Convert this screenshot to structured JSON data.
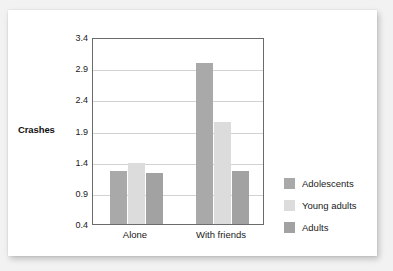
{
  "chart_data": {
    "type": "bar",
    "title": "",
    "xlabel": "",
    "ylabel": "Crashes",
    "categories": [
      "Alone",
      "With friends"
    ],
    "series": [
      {
        "name": "Adolescents",
        "color": "#a9a9a9",
        "values": [
          1.25,
          2.98
        ]
      },
      {
        "name": "Young adults",
        "color": "#dcdcdc",
        "values": [
          1.38,
          2.03
        ]
      },
      {
        "name": "Adults",
        "color": "#a2a2a2",
        "values": [
          1.22,
          1.25
        ]
      }
    ],
    "ylim": [
      0.4,
      3.4
    ],
    "ytick_values": [
      0.4,
      0.9,
      1.4,
      1.9,
      2.4,
      2.9,
      3.4
    ],
    "ytick_labels": [
      "0.4",
      "0.9",
      "1.4",
      "1.9",
      "2.4",
      "2.9",
      "3.4"
    ],
    "grid": "horizontal",
    "legend_position": "right"
  },
  "axes": {
    "y_title": "Crashes"
  },
  "legend": {
    "items": [
      {
        "label": "Adolescents",
        "color": "#a9a9a9"
      },
      {
        "label": "Young adults",
        "color": "#dcdcdc"
      },
      {
        "label": "Adults",
        "color": "#a2a2a2"
      }
    ]
  },
  "colors": {
    "card_background": "#ffffff",
    "page_background": "#f2f2f2",
    "frame": "#6b6b6b",
    "gridline": "#d2d2d2",
    "text": "#1a1a1a"
  }
}
